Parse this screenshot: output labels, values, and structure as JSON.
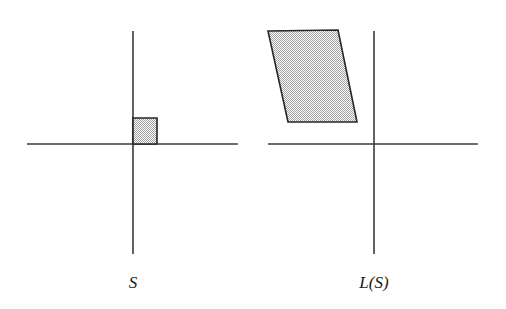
{
  "figure": {
    "width": 506,
    "height": 309,
    "background_color": "#ffffff"
  },
  "style": {
    "axis_color": "#3a3a3a",
    "axis_stroke_width": 1.6,
    "shape_outline_color": "#262626",
    "shape_outline_width": 1.6,
    "shape_fill_color": "#d4d4d4",
    "shape_fill_pattern": "fine-checkerboard-dither",
    "caption_color": "#1a1a1a",
    "caption_font_size": 17,
    "caption_font_style": "italic"
  },
  "panels": [
    {
      "id": "source",
      "caption": "S",
      "caption_x": 133,
      "caption_y": 282,
      "axes": {
        "origin_x": 133,
        "origin_y": 144,
        "x_axis": {
          "x1": 27,
          "y1": 144,
          "x2": 238,
          "y2": 144
        },
        "y_axis": {
          "x1": 133,
          "y1": 31,
          "x2": 133,
          "y2": 254
        }
      },
      "shape": {
        "name": "unit-square",
        "kind": "square",
        "points": "133,118 157,118 157,144 133,144",
        "vertices": [
          {
            "x": 133,
            "y": 118
          },
          {
            "x": 157,
            "y": 118
          },
          {
            "x": 157,
            "y": 144
          },
          {
            "x": 133,
            "y": 144
          }
        ]
      }
    },
    {
      "id": "image",
      "caption": "L(S)",
      "caption_x": 374,
      "caption_y": 282,
      "axes": {
        "origin_x": 374,
        "origin_y": 144,
        "x_axis": {
          "x1": 268,
          "y1": 144,
          "x2": 478,
          "y2": 144
        },
        "y_axis": {
          "x1": 374,
          "y1": 31,
          "x2": 374,
          "y2": 254
        }
      },
      "shape": {
        "name": "sheared-parallelogram",
        "kind": "parallelogram",
        "points": "268,31 338,30 357,122 288,122",
        "vertices": [
          {
            "x": 268,
            "y": 31
          },
          {
            "x": 338,
            "y": 30
          },
          {
            "x": 357,
            "y": 122
          },
          {
            "x": 288,
            "y": 122
          }
        ]
      }
    }
  ]
}
